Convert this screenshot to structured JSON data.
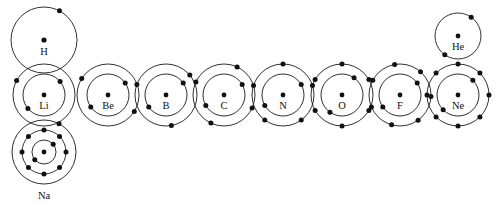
{
  "diagram": {
    "type": "bohr-atomic-shell-diagram",
    "background_color": "#ffffff",
    "stroke_color": "#1a1a1a",
    "dot_color": "#111111",
    "atoms": [
      {
        "symbol": "H",
        "name": "hydrogen",
        "atomic_number": 1,
        "label_position": "inside-below-nucleus",
        "cx": 44,
        "cy": 40,
        "nucleus_r": 2.6,
        "label_dy": 13,
        "shells": [
          {
            "index": 1,
            "radius": 33,
            "electrons": 1,
            "start_angle": -62
          }
        ]
      },
      {
        "symbol": "He",
        "name": "helium",
        "atomic_number": 2,
        "label_position": "inside-below-nucleus",
        "cx": 458,
        "cy": 36,
        "nucleus_r": 2.4,
        "label_dy": 12,
        "shells": [
          {
            "index": 1,
            "radius": 23,
            "electrons": 2,
            "start_angle": -55
          }
        ]
      },
      {
        "symbol": "Li",
        "name": "lithium",
        "atomic_number": 3,
        "label_position": "inside-below-nucleus",
        "cx": 44,
        "cy": 95,
        "nucleus_r": 2.4,
        "label_dy": 12,
        "shells": [
          {
            "index": 1,
            "radius": 21,
            "electrons": 2,
            "start_angle": -40
          },
          {
            "index": 2,
            "radius": 31,
            "electrons": 1,
            "start_angle": -152
          }
        ]
      },
      {
        "symbol": "Be",
        "name": "beryllium",
        "atomic_number": 4,
        "label_position": "inside-below-nucleus",
        "cx": 108,
        "cy": 95,
        "nucleus_r": 2.4,
        "label_dy": 12,
        "shells": [
          {
            "index": 1,
            "radius": 21,
            "electrons": 2,
            "start_angle": -35
          },
          {
            "index": 2,
            "radius": 31,
            "electrons": 2,
            "start_angle": -148
          }
        ]
      },
      {
        "symbol": "B",
        "name": "boron",
        "atomic_number": 5,
        "label_position": "inside-below-nucleus",
        "cx": 166,
        "cy": 95,
        "nucleus_r": 2.4,
        "label_dy": 12,
        "shells": [
          {
            "index": 1,
            "radius": 21,
            "electrons": 2,
            "start_angle": -35
          },
          {
            "index": 2,
            "radius": 31,
            "electrons": 3,
            "start_angle": -160
          }
        ]
      },
      {
        "symbol": "C",
        "name": "carbon",
        "atomic_number": 6,
        "label_position": "inside-below-nucleus",
        "cx": 224,
        "cy": 95,
        "nucleus_r": 2.4,
        "label_dy": 12,
        "shells": [
          {
            "index": 1,
            "radius": 21,
            "electrons": 2,
            "start_angle": -30
          },
          {
            "index": 2,
            "radius": 31,
            "electrons": 4,
            "start_angle": -155
          }
        ]
      },
      {
        "symbol": "N",
        "name": "nitrogen",
        "atomic_number": 7,
        "label_position": "inside-below-nucleus",
        "cx": 283,
        "cy": 95,
        "nucleus_r": 2.4,
        "label_dy": 12,
        "shells": [
          {
            "index": 1,
            "radius": 21,
            "electrons": 2,
            "start_angle": -30
          },
          {
            "index": 2,
            "radius": 31,
            "electrons": 5,
            "start_angle": -90
          }
        ]
      },
      {
        "symbol": "O",
        "name": "oxygen",
        "atomic_number": 8,
        "label_position": "inside-below-nucleus",
        "cx": 342,
        "cy": 95,
        "nucleus_r": 2.4,
        "label_dy": 12,
        "shells": [
          {
            "index": 1,
            "radius": 21,
            "electrons": 2,
            "start_angle": -55
          },
          {
            "index": 2,
            "radius": 31,
            "electrons": 6,
            "start_angle": -90
          }
        ]
      },
      {
        "symbol": "F",
        "name": "fluorine",
        "atomic_number": 9,
        "label_position": "inside-below-nucleus",
        "cx": 400,
        "cy": 95,
        "nucleus_r": 2.4,
        "label_dy": 12,
        "shells": [
          {
            "index": 1,
            "radius": 21,
            "electrons": 2,
            "start_angle": -35
          },
          {
            "index": 2,
            "radius": 31,
            "electrons": 7,
            "start_angle": -100
          }
        ]
      },
      {
        "symbol": "Ne",
        "name": "neon",
        "atomic_number": 10,
        "label_position": "inside-below-nucleus",
        "cx": 458,
        "cy": 95,
        "nucleus_r": 2.4,
        "label_dy": 12,
        "shells": [
          {
            "index": 1,
            "radius": 21,
            "electrons": 2,
            "start_angle": -45
          },
          {
            "index": 2,
            "radius": 31,
            "electrons": 8,
            "start_angle": -90
          }
        ]
      },
      {
        "symbol": "Na",
        "name": "sodium",
        "atomic_number": 11,
        "label_position": "outside-below",
        "cx": 44,
        "cy": 152,
        "nucleus_r": 2.4,
        "label_dy": 45,
        "shells": [
          {
            "index": 1,
            "radius": 12,
            "electrons": 2,
            "start_angle": -40
          },
          {
            "index": 2,
            "radius": 22,
            "electrons": 8,
            "start_angle": -90
          },
          {
            "index": 3,
            "radius": 32,
            "electrons": 1,
            "start_angle": -62
          }
        ]
      }
    ]
  }
}
